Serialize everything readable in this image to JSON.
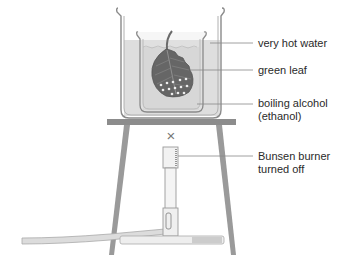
{
  "diagram": {
    "labels": {
      "very_hot_water": "very hot water",
      "green_leaf": "green leaf",
      "boiling_alcohol_line1": "boiling alcohol",
      "boiling_alcohol_line2": "(ethanol)",
      "bunsen_line1": "Bunsen burner",
      "bunsen_line2": "turned off"
    },
    "flame_off_symbol": "×",
    "colors": {
      "outer_liquid": "#dcdcdc",
      "inner_liquid": "#cfcfcf",
      "leaf": "#6a6a6a",
      "leaf_vein": "#9a9a9a",
      "tripod": "#8c8c8c",
      "glass": "#888888",
      "leader_line": "#888888",
      "text": "#2a2a2a"
    }
  }
}
